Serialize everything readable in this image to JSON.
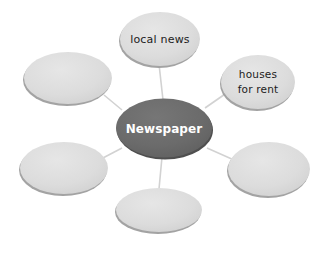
{
  "diagram": {
    "type": "mind-map",
    "background_color": "#ffffff",
    "center": {
      "label": "Newspaper",
      "fill_color": "#6b6b6b",
      "text_color": "#ffffff",
      "cx": 164,
      "cy": 128,
      "rx": 48,
      "ry": 29.5
    },
    "branch_style": {
      "fill_color": "#dcdcdc",
      "edge_shadow_color": "#9a9a9a",
      "text_color": "#1c1c1c",
      "connector_color": "#d2d2d2"
    },
    "branches": [
      {
        "id": "top",
        "label": "local news",
        "lines": [
          "local news"
        ],
        "cx": 160,
        "cy": 39,
        "rx": 40,
        "ry": 27
      },
      {
        "id": "upper-right",
        "label": "houses for rent",
        "lines": [
          "houses",
          "for rent"
        ],
        "cx": 258,
        "cy": 82,
        "rx": 37,
        "ry": 27
      },
      {
        "id": "upper-left",
        "label": "",
        "lines": [],
        "cx": 68,
        "cy": 78,
        "rx": 44,
        "ry": 26
      },
      {
        "id": "lower-left",
        "label": "",
        "lines": [],
        "cx": 64,
        "cy": 168,
        "rx": 44,
        "ry": 26
      },
      {
        "id": "bottom",
        "label": "",
        "lines": [],
        "cx": 159,
        "cy": 210,
        "rx": 43,
        "ry": 22
      },
      {
        "id": "lower-right",
        "label": "",
        "lines": [],
        "cx": 269,
        "cy": 169,
        "rx": 41,
        "ry": 27
      }
    ],
    "connectors": [
      {
        "id": "center-to-top",
        "x1": 163,
        "x2": 159,
        "y1": 100,
        "y2": 64
      },
      {
        "id": "center-to-upper-right",
        "x1": 205,
        "x2": 228,
        "y1": 108,
        "y2": 92
      },
      {
        "id": "center-to-upper-left",
        "x1": 122,
        "x2": 104,
        "y1": 110,
        "y2": 95
      },
      {
        "id": "center-to-lower-left",
        "x1": 122,
        "x2": 101,
        "y1": 148,
        "y2": 159
      },
      {
        "id": "center-to-bottom",
        "x1": 162,
        "x2": 159,
        "y1": 157,
        "y2": 189
      },
      {
        "id": "center-to-lower-right",
        "x1": 207,
        "x2": 234,
        "y1": 148,
        "y2": 160
      }
    ]
  }
}
